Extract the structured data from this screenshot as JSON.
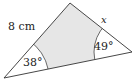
{
  "diagram": {
    "type": "triangle-with-sectors",
    "side_label": "8 cm",
    "unknown_label": "x",
    "angles": [
      {
        "vertex": "bottom-left",
        "label": "38°"
      },
      {
        "vertex": "right",
        "label": "49°"
      }
    ],
    "colors": {
      "shading": "#e6e6e6",
      "stroke": "#333333"
    }
  }
}
